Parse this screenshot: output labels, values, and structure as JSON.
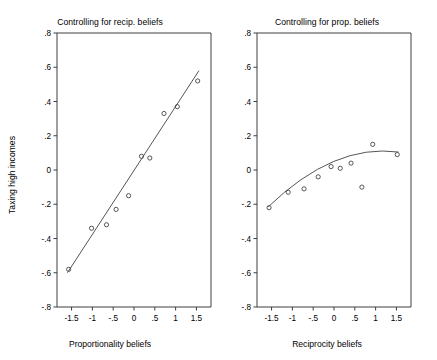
{
  "figure": {
    "width": 437,
    "height": 360,
    "background": "#ffffff",
    "ylabel": "Taxing high incomes"
  },
  "chart_data": [
    {
      "type": "scatter",
      "panel": "left",
      "title": "Controlling for recip. beliefs",
      "xlabel": "Proportionality beliefs",
      "ylabel": "Taxing high incomes",
      "xlim": [
        -1.85,
        1.85
      ],
      "ylim": [
        -0.8,
        0.8
      ],
      "xticks": [
        -1.5,
        -1,
        -0.5,
        0,
        0.5,
        1,
        1.5
      ],
      "xticklabels": [
        "-1.5",
        "-1",
        "-.5",
        "0",
        ".5",
        "1",
        "1.5"
      ],
      "yticks": [
        -0.8,
        -0.6,
        -0.4,
        -0.2,
        0,
        0.2,
        0.4,
        0.6,
        0.8
      ],
      "yticklabels": [
        "-.8",
        "-.6",
        "-.4",
        "-.2",
        "0",
        ".2",
        ".4",
        ".6",
        ".8"
      ],
      "grid": false,
      "legend": null,
      "points": [
        {
          "x": -1.57,
          "y": -0.58
        },
        {
          "x": -1.02,
          "y": -0.34
        },
        {
          "x": -0.66,
          "y": -0.32
        },
        {
          "x": -0.43,
          "y": -0.23
        },
        {
          "x": -0.13,
          "y": -0.15
        },
        {
          "x": 0.18,
          "y": 0.08
        },
        {
          "x": 0.38,
          "y": 0.07
        },
        {
          "x": 0.72,
          "y": 0.33
        },
        {
          "x": 1.04,
          "y": 0.37
        },
        {
          "x": 1.53,
          "y": 0.52
        }
      ],
      "fit_line": {
        "kind": "linear",
        "endpoints": [
          {
            "x": -1.6,
            "y": -0.6
          },
          {
            "x": 1.56,
            "y": 0.58
          }
        ]
      }
    },
    {
      "type": "scatter",
      "panel": "right",
      "title": "Controlling for prop. beliefs",
      "xlabel": "Reciprocity beliefs",
      "ylabel": "Taxing high incomes",
      "xlim": [
        -1.85,
        1.85
      ],
      "ylim": [
        -0.8,
        0.8
      ],
      "xticks": [
        -1.5,
        -1,
        -0.5,
        0,
        0.5,
        1,
        1.5
      ],
      "xticklabels": [
        "-1.5",
        "-1",
        "-.5",
        "0",
        ".5",
        "1",
        "1.5"
      ],
      "yticks": [
        -0.8,
        -0.6,
        -0.4,
        -0.2,
        0,
        0.2,
        0.4,
        0.6,
        0.8
      ],
      "yticklabels": [
        "-.8",
        "-.6",
        "-.4",
        "-.2",
        "0",
        ".2",
        ".4",
        ".6",
        ".8"
      ],
      "grid": false,
      "legend": null,
      "points": [
        {
          "x": -1.56,
          "y": -0.22
        },
        {
          "x": -1.1,
          "y": -0.13
        },
        {
          "x": -0.72,
          "y": -0.11
        },
        {
          "x": -0.38,
          "y": -0.04
        },
        {
          "x": -0.07,
          "y": 0.02
        },
        {
          "x": 0.15,
          "y": 0.01
        },
        {
          "x": 0.41,
          "y": 0.04
        },
        {
          "x": 0.67,
          "y": -0.1
        },
        {
          "x": 0.93,
          "y": 0.15
        },
        {
          "x": 1.52,
          "y": 0.09
        }
      ],
      "fit_line": {
        "kind": "quadratic-concave",
        "endpoints": [
          {
            "x": -1.58,
            "y": -0.215
          },
          {
            "x": 1.55,
            "y": 0.105
          }
        ],
        "control": {
          "x": 0.0,
          "y": 0.05
        }
      }
    }
  ]
}
